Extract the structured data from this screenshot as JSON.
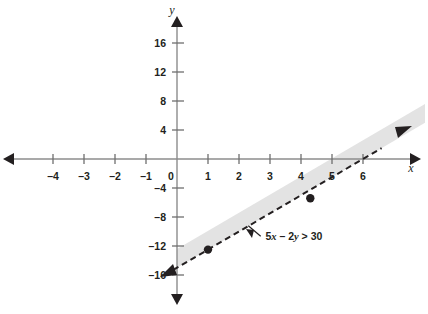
{
  "figure": {
    "background_color": "#ffffff"
  },
  "chart_data": {
    "type": "line",
    "title": "",
    "subtitle": "",
    "xlabel": "x",
    "ylabel": "y",
    "xlim": [
      -5.5,
      7.2
    ],
    "ylim": [
      -18.5,
      19.5
    ],
    "grid": false,
    "legend_position": "none",
    "x_ticks": [
      -4,
      -3,
      -2,
      -1,
      0,
      1,
      2,
      3,
      4,
      5,
      6
    ],
    "x_tick_labels": [
      "–4",
      "–3",
      "–2",
      "–1",
      "0",
      "1",
      "2",
      "3",
      "4",
      "5",
      "6"
    ],
    "y_ticks": [
      16,
      12,
      8,
      4,
      -4,
      -8,
      -12,
      -16
    ],
    "y_tick_labels": [
      "16",
      "12",
      "8",
      "4",
      "–4",
      "–8",
      "–12",
      "–16"
    ],
    "series": [
      {
        "name": "boundary-line",
        "equation": "5x - 2y = 30",
        "slope": 2.5,
        "y_intercept": -15,
        "x_intercept": 6,
        "line_style": "dashed",
        "color": "#231f20",
        "arrow_both_ends": true,
        "x_range": [
          -0.4,
          6.6
        ]
      }
    ],
    "points": [
      {
        "label": "",
        "x": 1,
        "y": -12.5,
        "style": "filled-circle",
        "color": "#231f20"
      },
      {
        "label": "",
        "x": 4.3,
        "y": -5.4,
        "style": "filled-circle",
        "color": "#231f20"
      }
    ],
    "shaded_region": {
      "name": "solution-band",
      "description": "light gray band above the dashed boundary line",
      "fill_color": "#e3e3e3",
      "side": "above-left",
      "band_width_units": 2.6
    },
    "annotations": [
      {
        "name": "inequality-label",
        "text_parts": [
          "5",
          "x",
          " – 2",
          "y",
          " > 30"
        ],
        "text": "5x – 2y > 30",
        "x": 2.85,
        "y": -11.2,
        "leader_to_x": 2.3,
        "leader_to_y": -9.2
      }
    ],
    "axis_colors": {
      "axis_line": "#8c8c8c",
      "axis_arrow": "#231f20",
      "tick": "#6f6f6f",
      "text": "#231f20"
    }
  }
}
